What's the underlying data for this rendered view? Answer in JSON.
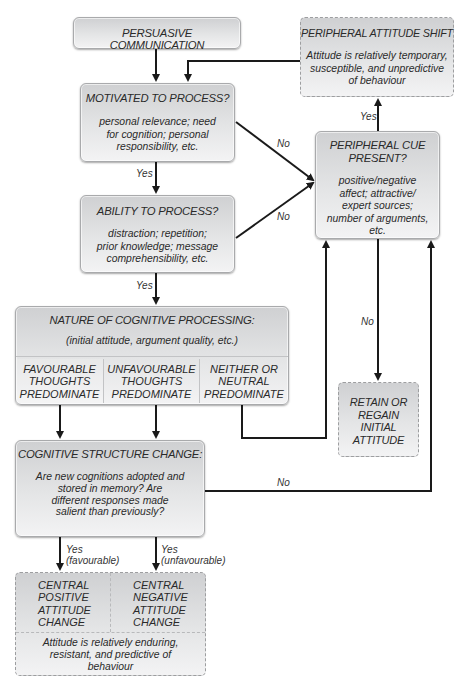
{
  "nodes": {
    "persuasive_communication": {
      "title": "PERSUASIVE COMMUNICATION"
    },
    "motivated": {
      "title": "MOTIVATED TO PROCESS?",
      "body": [
        "personal relevance; need",
        "for cognition; personal",
        "responsibility, etc."
      ]
    },
    "ability": {
      "title": "ABILITY TO PROCESS?",
      "body": [
        "distraction; repetition;",
        "prior knowledge; message",
        "comprehensibility, etc."
      ]
    },
    "peripheral_shift": {
      "title": "PERIPHERAL ATTITUDE SHIFT",
      "body": [
        "Attitude is relatively temporary,",
        "susceptible, and unpredictive",
        "of behaviour"
      ]
    },
    "peripheral_cue": {
      "title": [
        "PERIPHERAL CUE",
        "PRESENT?"
      ],
      "body": [
        "positive/negative",
        "affect; attractive/",
        "expert sources;",
        "number of arguments,",
        "etc."
      ]
    },
    "nature": {
      "title": "NATURE OF COGNITIVE PROCESSING:",
      "subtitle": "(initial attitude, argument quality, etc.)",
      "cols": [
        [
          "FAVOURABLE",
          "THOUGHTS",
          "PREDOMINATE"
        ],
        [
          "UNFAVOURABLE",
          "THOUGHTS",
          "PREDOMINATE"
        ],
        [
          "NEITHER OR",
          "NEUTRAL",
          "PREDOMINATE"
        ]
      ]
    },
    "retain": {
      "lines": [
        "RETAIN OR",
        "REGAIN",
        "INITIAL",
        "ATTITUDE"
      ]
    },
    "structure": {
      "title": "COGNITIVE STRUCTURE CHANGE:",
      "body": [
        "Are new cognitions adopted and",
        "stored in memory? Are",
        "different responses made",
        "salient than previously?"
      ]
    },
    "central": {
      "cols": [
        [
          "CENTRAL",
          "POSITIVE",
          "ATTITUDE",
          "CHANGE"
        ],
        [
          "CENTRAL",
          "NEGATIVE",
          "ATTITUDE",
          "CHANGE"
        ]
      ],
      "body": [
        "Attitude is relatively enduring,",
        "resistant, and predictive of",
        "behaviour"
      ]
    }
  },
  "edge_labels": {
    "motivated_no": "No",
    "motivated_yes": "Yes",
    "ability_no": "No",
    "ability_yes": "Yes",
    "cue_yes": "Yes",
    "cue_no": "No",
    "structure_no": "No",
    "structure_yes_fav": [
      "Yes",
      "(favourable)"
    ],
    "structure_yes_unfav": [
      "Yes",
      "(unfavourable)"
    ]
  }
}
